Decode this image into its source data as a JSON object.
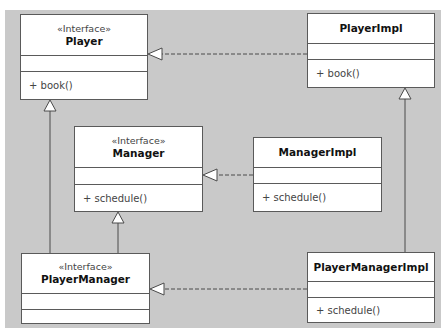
{
  "diagram": {
    "type": "UML class diagram",
    "background_color": "#c9c9c9",
    "classes": [
      {
        "id": "player",
        "stereotype": "«Interface»",
        "name": "Player",
        "attributes": [],
        "operations": [
          "+ book()"
        ]
      },
      {
        "id": "player_impl",
        "stereotype": "",
        "name": "PlayerImpl",
        "attributes": [],
        "operations": [
          "+ book()"
        ]
      },
      {
        "id": "manager",
        "stereotype": "«Interface»",
        "name": "Manager",
        "attributes": [],
        "operations": [
          "+ schedule()"
        ]
      },
      {
        "id": "manager_impl",
        "stereotype": "",
        "name": "ManagerImpl",
        "attributes": [],
        "operations": [
          "+ schedule()"
        ]
      },
      {
        "id": "player_manager",
        "stereotype": "«Interface»",
        "name": "PlayerManager",
        "attributes": [],
        "operations": []
      },
      {
        "id": "player_manager_impl",
        "stereotype": "",
        "name": "PlayerManagerImpl",
        "attributes": [],
        "operations": [
          "+ schedule()"
        ]
      }
    ],
    "relationships": [
      {
        "from": "PlayerImpl",
        "to": "Player",
        "type": "realization"
      },
      {
        "from": "ManagerImpl",
        "to": "Manager",
        "type": "realization"
      },
      {
        "from": "PlayerManagerImpl",
        "to": "PlayerManager",
        "type": "realization"
      },
      {
        "from": "PlayerManager",
        "to": "Player",
        "type": "generalization"
      },
      {
        "from": "PlayerManager",
        "to": "Manager",
        "type": "generalization"
      },
      {
        "from": "PlayerManagerImpl",
        "to": "PlayerImpl",
        "type": "generalization"
      }
    ]
  }
}
